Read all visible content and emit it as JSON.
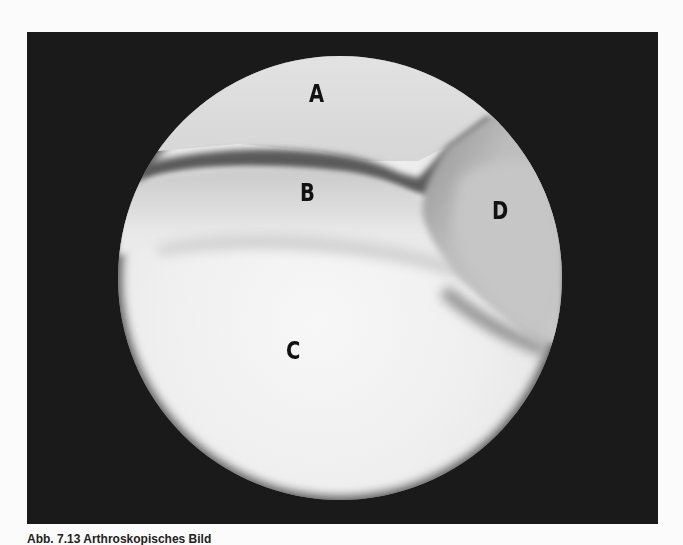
{
  "figure": {
    "labels": {
      "a": "A",
      "b": "B",
      "c": "C",
      "d": "D"
    },
    "caption": "Abb. 7.13  Arthroskopisches Bild",
    "colors": {
      "frame": "#1a1a1a",
      "page": "#fbfbfb",
      "label": "#111111"
    }
  }
}
